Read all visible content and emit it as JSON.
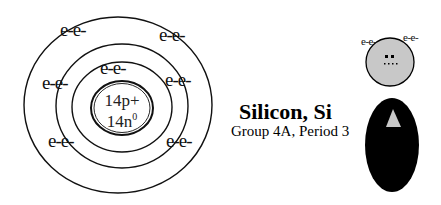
{
  "title": "Silicon, Si",
  "subtitle": "Group 4A, Period 3",
  "nucleus": {
    "protons": "14p+",
    "neutrons_prefix": "14n",
    "neutrons_sup": "0"
  },
  "shells": [
    {
      "name": "shell-1",
      "electrons": [
        "e-e-"
      ]
    },
    {
      "name": "shell-2",
      "electrons": [
        "e-e-",
        "e-e-",
        "e-e-",
        "e-e-"
      ]
    },
    {
      "name": "shell-3",
      "electrons": [
        "e-e-",
        "e-e-"
      ]
    }
  ],
  "electron_labels": {
    "outer_top_left": "e-e-",
    "outer_top_right": "e-e-",
    "inner_top": "e-e-",
    "middle_left": "e-e-",
    "middle_right": "e-e-",
    "middle_bottom_left": "e-e-",
    "middle_bottom_right": "e-e-"
  },
  "lewis_figure": {
    "left_label": "e-e-",
    "right_label": "e-e-",
    "head_color": "#c8c8c8",
    "body_color": "#000000",
    "triangle_color": "#c8c8c8"
  },
  "colors": {
    "stroke": "#111111",
    "background": "#ffffff"
  }
}
